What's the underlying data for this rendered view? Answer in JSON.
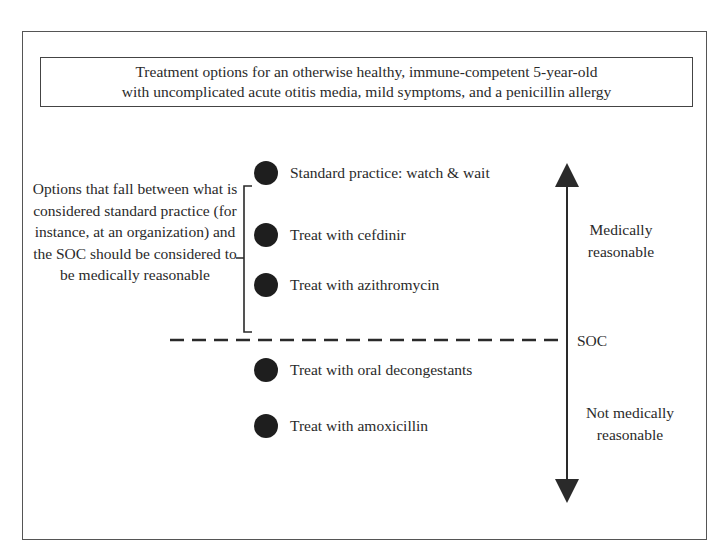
{
  "title": {
    "line1": "Treatment options for an otherwise healthy, immune-competent 5-year-old",
    "line2": "with uncomplicated acute otitis media, mild symptoms, and a penicillin allergy"
  },
  "bracket_note": "Options that fall between what is considered standard practice (for instance, at an organization) and the SOC should be considered to be medically reasonable",
  "options": [
    {
      "label": "Standard practice: watch & wait",
      "zone": "medically reasonable"
    },
    {
      "label": "Treat with cefdinir",
      "zone": "medically reasonable"
    },
    {
      "label": "Treat with azithromycin",
      "zone": "medically reasonable"
    },
    {
      "label": "Treat with oral decongestants",
      "zone": "not medically reasonable"
    },
    {
      "label": "Treat with amoxicillin",
      "zone": "not medically reasonable"
    }
  ],
  "axis": {
    "top_label": {
      "line1": "Medically",
      "line2": "reasonable"
    },
    "threshold_label": "SOC",
    "bottom_label": {
      "line1": "Not medically",
      "line2": "reasonable"
    }
  },
  "colors": {
    "bullet": "#1e1e1e",
    "line": "#2a2a2a",
    "border": "#555555"
  }
}
